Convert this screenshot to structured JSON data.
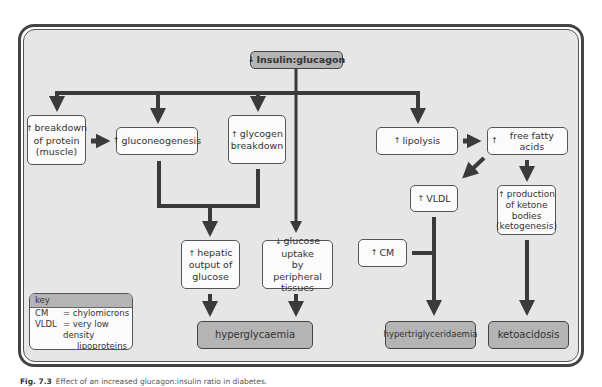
{
  "diagram": {
    "root": {
      "arrow": "↓",
      "label": "Insulin:glucagon"
    },
    "nodes": {
      "protein_breakdown": {
        "arrow": "↑",
        "label": "breakdown\nof protein\n(muscle)"
      },
      "gluconeogenesis": {
        "arrow": "↑",
        "label": "gluconeogenesis"
      },
      "glycogen_breakdown": {
        "arrow": "↑",
        "label": "glycogen\nbreakdown"
      },
      "lipolysis": {
        "arrow": "↑",
        "label": "lipolysis"
      },
      "free_fatty_acids": {
        "arrow": "↑",
        "label": "free fatty acids"
      },
      "vldl": {
        "arrow": "↑",
        "label": "VLDL"
      },
      "ketone_production": {
        "arrow": "↑",
        "label": "production\nof ketone\nbodies\n(ketogenesis)"
      },
      "hepatic_output": {
        "arrow": "↑",
        "label": "hepatic\noutput of\nglucose"
      },
      "glucose_uptake": {
        "arrow": "↓",
        "label": "glucose uptake\nby peripheral\ntissues"
      },
      "cm": {
        "arrow": "↑",
        "label": "CM"
      }
    },
    "outcomes": {
      "hyperglycaemia": "hyperglycaemia",
      "hypertriglyceridaemia": "hypertriglyceridaemia",
      "ketoacidosis": "ketoacidosis"
    },
    "key": {
      "title": "key",
      "entries": [
        {
          "abbr": "CM",
          "def": "= chylomicrons"
        },
        {
          "abbr": "VLDL",
          "def": "= very low density",
          "cont": "lipoproteins"
        }
      ]
    }
  },
  "caption": {
    "label": "Fig. 7.3",
    "text": "Effect of an increased glucagon:insulin ratio in diabetes."
  },
  "colors": {
    "background": "#e6e6e6",
    "box_fill": "#fbfbfb",
    "outcome_fill": "#b4b4b4",
    "arrow": "#3a3a3a"
  }
}
